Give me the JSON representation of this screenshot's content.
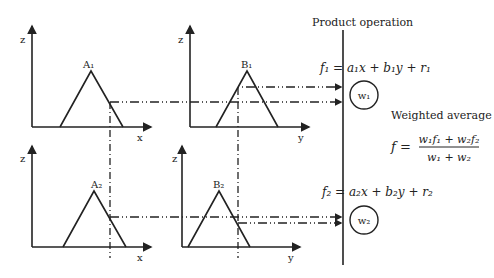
{
  "panels": [
    {
      "id": "top-x",
      "y_axis_label": "z",
      "x_axis_label": "x",
      "membership_label": "A₁"
    },
    {
      "id": "top-y",
      "y_axis_label": "z",
      "x_axis_label": "y",
      "membership_label": "B₁"
    },
    {
      "id": "bottom-x",
      "y_axis_label": "z",
      "x_axis_label": "x",
      "membership_label": "A₂"
    },
    {
      "id": "bottom-y",
      "y_axis_label": "z",
      "x_axis_label": "y",
      "membership_label": "B₂"
    }
  ],
  "product_operation_label": "Product operation",
  "rule1": {
    "equation": "f₁ = a₁x + b₁y + r₁",
    "weight": "w₁"
  },
  "rule2": {
    "equation": "f₂ = a₂x + b₂y + r₂",
    "weight": "w₂"
  },
  "weighted_average": {
    "label": "Weighted average",
    "lhs": "f =",
    "numerator": "w₁f₁ + w₂f₂",
    "denominator": "w₁ + w₂"
  },
  "colors": {
    "line": "#222222",
    "background": "#ffffff"
  }
}
